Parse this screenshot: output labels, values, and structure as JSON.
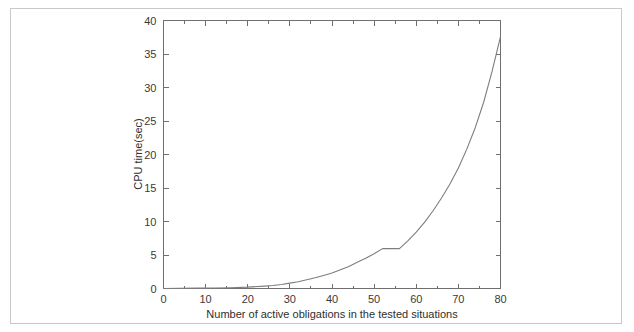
{
  "figure": {
    "background_color": "#ffffff",
    "border_color": "#c9c9c9",
    "line_color": "#7d7d7d",
    "axis_color": "#6f6f6f",
    "text_color": "#2e2e2e"
  },
  "chart_data": {
    "type": "line",
    "title": "",
    "subtitle": "",
    "xlabel": "Number of active obligations in the tested situations",
    "ylabel": "CPU time(sec)",
    "xlim": [
      0,
      80
    ],
    "ylim": [
      0,
      40
    ],
    "xticks": [
      0,
      10,
      20,
      30,
      40,
      50,
      60,
      70,
      80
    ],
    "xtick_labels": [
      "0",
      "10",
      "20",
      "30",
      "40",
      "50",
      "60",
      "70",
      "80"
    ],
    "xminor_ticks": [
      5,
      15,
      25,
      35,
      45,
      55,
      65,
      75
    ],
    "yticks": [
      0,
      5,
      10,
      15,
      20,
      25,
      30,
      35,
      40
    ],
    "ytick_labels": [
      "0",
      "5",
      "10",
      "15",
      "20",
      "25",
      "30",
      "35",
      "40"
    ],
    "grid": false,
    "legend": null,
    "legend_position": "none",
    "box_frame": true,
    "tick_direction": "in",
    "annotations": [
      "flat plateau at approximately 6 sec between 52 and 56 obligations"
    ],
    "series": [
      {
        "name": "CPU time",
        "color": "#7d7d7d",
        "x": [
          0,
          4,
          8,
          12,
          16,
          20,
          24,
          26,
          28,
          30,
          32,
          34,
          36,
          38,
          40,
          42,
          44,
          46,
          48,
          50,
          52,
          54,
          56,
          58,
          60,
          62,
          64,
          66,
          68,
          70,
          72,
          74,
          76,
          78,
          80
        ],
        "y": [
          0.0,
          0.02,
          0.05,
          0.08,
          0.12,
          0.2,
          0.35,
          0.45,
          0.6,
          0.8,
          1.0,
          1.3,
          1.6,
          1.95,
          2.3,
          2.8,
          3.3,
          3.9,
          4.5,
          5.2,
          5.95,
          5.95,
          5.95,
          7.1,
          8.4,
          9.9,
          11.6,
          13.5,
          15.6,
          18.0,
          20.8,
          24.0,
          27.8,
          32.4,
          37.6
        ]
      }
    ]
  },
  "axis_titles": {
    "x": "Number of active obligations in the tested situations",
    "y": "CPU time(sec)"
  }
}
